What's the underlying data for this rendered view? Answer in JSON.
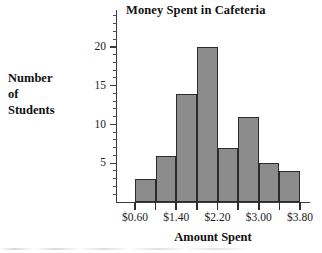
{
  "chart_data": {
    "type": "bar",
    "title": "Money Spent in Cafeteria",
    "xlabel": "Amount Spent",
    "ylabel": "Number of Students",
    "ylabel_lines": [
      "Number",
      "of",
      "Students"
    ],
    "categories": [
      "$0.60",
      "$1.00",
      "$1.40",
      "$1.80",
      "$2.20",
      "$2.60",
      "$3.00",
      "$3.40"
    ],
    "bin_edges": [
      "$0.60",
      "$1.00",
      "$1.40",
      "$1.80",
      "$2.20",
      "$2.60",
      "$3.00",
      "$3.40",
      "$3.80"
    ],
    "values": [
      3,
      6,
      14,
      20,
      7,
      11,
      5,
      4
    ],
    "xtick_labels": [
      "$0.60",
      "$1.40",
      "$2.20",
      "$3.00",
      "$3.80"
    ],
    "ytick_labels": [
      "5",
      "10",
      "15",
      "20"
    ],
    "ytick_values": [
      5,
      10,
      15,
      20
    ],
    "yminor_step": 1,
    "ylim": [
      0,
      25
    ],
    "xlim": [
      "$0.60",
      "$3.80"
    ],
    "grid": false,
    "legend": false,
    "bar_color": "#8c8c8c",
    "bar_edge_color": "#2b2b2b",
    "axis_color": "#3a3a3a",
    "background": "#ffffff"
  },
  "figure": {
    "title": "Money Spent in Cafeteria",
    "xaxis_title": "Amount Spent",
    "yaxis_title_lines": [
      "Number",
      "of",
      "Students"
    ]
  }
}
